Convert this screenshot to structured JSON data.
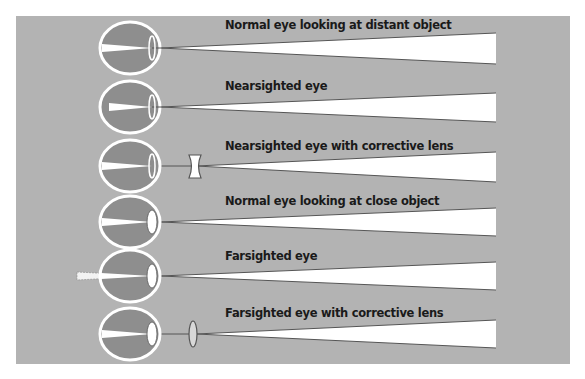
{
  "diagram": {
    "title": "",
    "type": "eye refraction comparison",
    "colors": {
      "background": "#ffffff",
      "panel": "#b3b3b3",
      "eye_fill": "#8e8e8e",
      "eye_outline": "#ffffff",
      "ray_fill": "#ffffff",
      "ray_edge": "#555555",
      "lens_outline": "#555555"
    },
    "rows": [
      {
        "label": "Normal eye looking at distant  object",
        "condition": "normal-distant",
        "corrective_lens": "none"
      },
      {
        "label": "Nearsighted eye",
        "condition": "nearsighted",
        "corrective_lens": "none"
      },
      {
        "label": "Nearsighted eye with corrective lens",
        "condition": "nearsighted-corrected",
        "corrective_lens": "concave"
      },
      {
        "label": "Normal eye looking at close object",
        "condition": "normal-close",
        "corrective_lens": "none"
      },
      {
        "label": "Farsighted eye",
        "condition": "farsighted",
        "corrective_lens": "none"
      },
      {
        "label": "Farsighted eye with corrective lens",
        "condition": "farsighted-corrected",
        "corrective_lens": "convex"
      }
    ]
  }
}
